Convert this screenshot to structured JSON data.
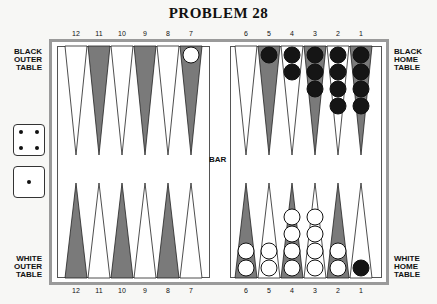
{
  "title": "PROBLEM 28",
  "labels": {
    "black_outer": [
      "BLACK",
      "OUTER",
      "TABLE"
    ],
    "black_home": [
      "BLACK",
      "HOME",
      "TABLE"
    ],
    "white_outer": [
      "WHITE",
      "OUTER",
      "TABLE"
    ],
    "white_home": [
      "WHITE",
      "HOME",
      "TABLE"
    ],
    "bar": "BAR"
  },
  "top_points": [
    "12",
    "11",
    "10",
    "9",
    "8",
    "7",
    "6",
    "5",
    "4",
    "3",
    "2",
    "1"
  ],
  "bottom_points": [
    "12",
    "11",
    "10",
    "9",
    "8",
    "7",
    "6",
    "5",
    "4",
    "3",
    "2",
    "1"
  ],
  "dice": [
    4,
    1
  ],
  "position": {
    "top": {
      "7": {
        "color": "white",
        "count": 1
      },
      "5": {
        "color": "black",
        "count": 1
      },
      "4": {
        "color": "black",
        "count": 2
      },
      "3": {
        "color": "black",
        "count": 3
      },
      "2": {
        "color": "black",
        "count": 4
      },
      "1": {
        "color": "black",
        "count": 4
      }
    },
    "bottom": {
      "6": {
        "color": "white",
        "count": 2
      },
      "5": {
        "color": "white",
        "count": 2
      },
      "4": {
        "color": "white",
        "count": 4
      },
      "3": {
        "color": "white",
        "count": 4
      },
      "2": {
        "color": "white",
        "count": 2
      },
      "1": {
        "color": "black",
        "count": 1
      }
    }
  },
  "colors": {
    "dark_point": "#7a7a7a",
    "light_point": "#ffffff",
    "frame": "#9a9a9a",
    "black_checker": "#151515",
    "white_checker": "#ffffff"
  }
}
